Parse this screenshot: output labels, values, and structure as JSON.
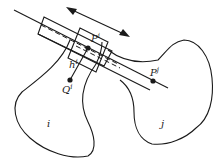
{
  "diagram": {
    "bodies": [
      {
        "id": "body-i",
        "label": "i"
      },
      {
        "id": "body-j",
        "label": "j"
      }
    ],
    "points": {
      "pi": {
        "base": "P",
        "sup": "i"
      },
      "pj": {
        "base": "P",
        "sup": "j"
      },
      "qi": {
        "base": "Q",
        "sup": "i"
      },
      "hi": {
        "base": "h",
        "sup": "i"
      }
    },
    "elements": [
      "joint axis line through P^i and P^j",
      "large rectangular guide (slot) along axis",
      "small rectangular slider at P^i",
      "double-headed arrow indicating translational direction",
      "vector h^i from Q^i to P^i"
    ],
    "colors": {
      "ink": "#1a1a1a",
      "background": "#ffffff"
    }
  }
}
